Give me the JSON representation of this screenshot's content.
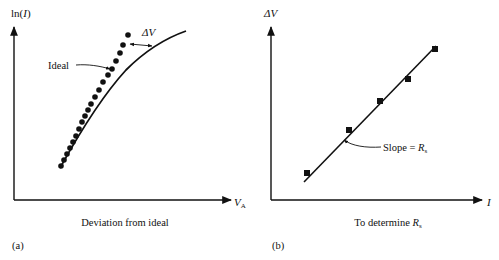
{
  "panel_a": {
    "tag": "(a)",
    "y_axis_label_prefix": "ln(",
    "y_axis_label_var": "I",
    "y_axis_label_suffix": ")",
    "x_axis_label_var": "V",
    "x_axis_label_sub": "A",
    "caption": "Deviation from ideal",
    "ideal_label": "Ideal",
    "delta_label": "ΔV",
    "ideal_curve": [
      [
        60,
        168
      ],
      [
        72,
        148
      ],
      [
        84,
        127
      ],
      [
        96,
        107
      ],
      [
        110,
        88
      ],
      [
        126,
        70
      ],
      [
        144,
        55
      ],
      [
        164,
        42
      ],
      [
        186,
        31
      ]
    ],
    "data_points": [
      [
        61,
        166
      ],
      [
        64,
        160
      ],
      [
        67,
        154
      ],
      [
        70,
        148
      ],
      [
        73,
        142
      ],
      [
        76,
        136
      ],
      [
        79,
        129
      ],
      [
        82,
        122
      ],
      [
        85,
        116
      ],
      [
        88,
        110
      ],
      [
        91,
        104
      ],
      [
        95,
        97
      ],
      [
        99,
        90
      ],
      [
        103,
        82
      ],
      [
        108,
        75
      ],
      [
        112,
        69
      ],
      [
        116,
        61
      ],
      [
        120,
        53
      ],
      [
        123,
        45
      ],
      [
        128,
        35
      ]
    ]
  },
  "panel_b": {
    "tag": "(b)",
    "y_axis_label": "ΔV",
    "x_axis_label": "I",
    "caption_prefix": "To determine ",
    "caption_var": "R",
    "caption_sub": "s",
    "slope_label_prefix": "Slope = ",
    "slope_label_var": "R",
    "slope_label_sub": "s",
    "fit_line": [
      [
        304,
        182
      ],
      [
        436,
        46
      ]
    ],
    "data_points": [
      [
        307,
        173
      ],
      [
        349,
        130
      ],
      [
        380,
        101
      ],
      [
        408,
        79
      ],
      [
        435,
        49
      ]
    ]
  },
  "colors": {
    "ink": "#111111",
    "background": "#ffffff"
  }
}
